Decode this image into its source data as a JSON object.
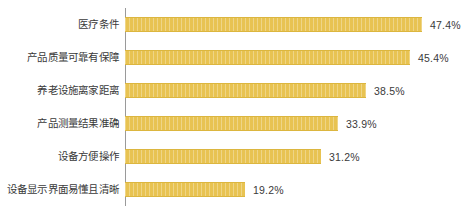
{
  "chart_data": {
    "type": "bar",
    "orientation": "horizontal",
    "title": "",
    "subtitle": "",
    "xlabel": "",
    "ylabel": "",
    "xlim": [
      0,
      55
    ],
    "grid": false,
    "legend": null,
    "bar_color": "#e8c352",
    "label_color": "#3a3a3a",
    "axis_color": "#9a9a9a",
    "value_suffix": "%",
    "categories": [
      "医疗条件",
      "产品质量可靠有保障",
      "养老设施离家距离",
      "产品测量结果准确",
      "设备方便操作",
      "设备显示界面易懂且清晰"
    ],
    "values": [
      47.4,
      45.4,
      38.5,
      33.9,
      31.2,
      19.2
    ],
    "value_labels": [
      "47.4%",
      "45.4%",
      "38.5%",
      "33.9%",
      "31.2%",
      "19.2%"
    ],
    "bars": [
      {
        "label": "医疗条件",
        "value": 47.4,
        "value_label": "47.4%"
      },
      {
        "label": "产品质量可靠有保障",
        "value": 45.4,
        "value_label": "45.4%"
      },
      {
        "label": "养老设施离家距离",
        "value": 38.5,
        "value_label": "38.5%"
      },
      {
        "label": "产品测量结果准确",
        "value": 33.9,
        "value_label": "33.9%"
      },
      {
        "label": "设备方便操作",
        "value": 31.2,
        "value_label": "31.2%"
      },
      {
        "label": "设备显示界面易懂且清晰",
        "value": 19.2,
        "value_label": "19.2%"
      }
    ]
  }
}
